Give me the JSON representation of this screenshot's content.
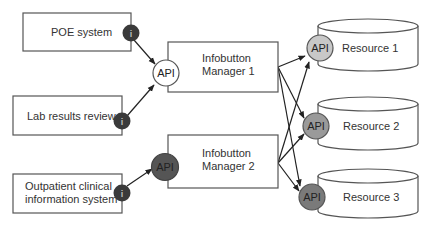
{
  "diagram": {
    "sources": [
      {
        "id": "poe",
        "label": "POE system",
        "lines": [
          "POE system"
        ],
        "infobutton": "i"
      },
      {
        "id": "lab",
        "label": "Lab results review",
        "lines": [
          "Lab results review"
        ],
        "infobutton": "i"
      },
      {
        "id": "outpatient",
        "label": "Outpatient clinical information system",
        "lines": [
          "Outpatient clinical",
          "information system"
        ],
        "infobutton": "i"
      }
    ],
    "managers": [
      {
        "id": "m1",
        "lines": [
          "Infobutton",
          "Manager 1"
        ],
        "api_label": "API",
        "api_color": "#ffffff"
      },
      {
        "id": "m2",
        "lines": [
          "Infobutton",
          "Manager 2"
        ],
        "api_label": "API",
        "api_color": "#555555"
      }
    ],
    "resources": [
      {
        "id": "r1",
        "label": "Resource 1",
        "api_label": "API",
        "api_color": "#c8c8c8"
      },
      {
        "id": "r2",
        "label": "Resource 2",
        "api_label": "API",
        "api_color": "#9a9a9a"
      },
      {
        "id": "r3",
        "label": "Resource 3",
        "api_label": "API",
        "api_color": "#7a7a7a"
      }
    ],
    "edges": [
      {
        "from": "poe",
        "to": "m1"
      },
      {
        "from": "lab",
        "to": "m1"
      },
      {
        "from": "outpatient",
        "to": "m2"
      },
      {
        "from": "m1",
        "to": "r1"
      },
      {
        "from": "m1",
        "to": "r2"
      },
      {
        "from": "m1",
        "to": "r3"
      },
      {
        "from": "m2",
        "to": "r1"
      },
      {
        "from": "m2",
        "to": "r2"
      },
      {
        "from": "m2",
        "to": "r3"
      }
    ],
    "colors": {
      "infobutton": "#3a3a3a",
      "stroke": "#555555",
      "arrow": "#222222"
    }
  }
}
